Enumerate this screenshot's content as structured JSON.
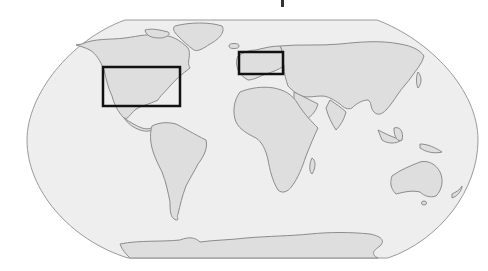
{
  "map": {
    "projection": "robinson-like",
    "colors": {
      "ocean": "#eeeeee",
      "land": "#dedede",
      "coastline": "#8c8c8c",
      "frame": "#9a9a9a",
      "highlight_box": "#111111",
      "background": "#ffffff"
    },
    "highlight_boxes": [
      {
        "name": "north-america-box",
        "region": "United States",
        "x": 103,
        "y": 67,
        "width": 77,
        "height": 39
      },
      {
        "name": "europe-box",
        "region": "Europe",
        "x": 239,
        "y": 52,
        "width": 44,
        "height": 22
      }
    ],
    "continents": [
      "North America",
      "South America",
      "Europe",
      "Africa",
      "Asia",
      "Australia",
      "Antarctica",
      "Greenland"
    ]
  }
}
